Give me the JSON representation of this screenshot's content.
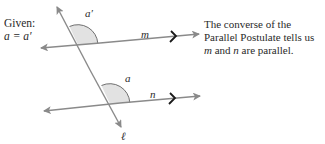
{
  "given": {
    "title": "Given:",
    "equation": "a = a′"
  },
  "note": {
    "line1": "The converse of the",
    "line2": "Parallel Postulate tells us",
    "line3_var1": "m",
    "line3_mid": " and ",
    "line3_var2": "n",
    "line3_end": " are parallel."
  },
  "labels": {
    "angle_top": "a′",
    "angle_bottom": "a",
    "line_m": "m",
    "line_n": "n",
    "transversal": "ℓ"
  },
  "colors": {
    "line": "#8a8a8a",
    "angle_fill": "#e2e2e2",
    "angle_arc": "#6f6f6f",
    "parallel_mark": "#1a1a1a",
    "text": "#2a2a2a"
  }
}
